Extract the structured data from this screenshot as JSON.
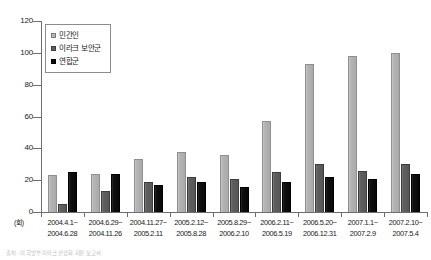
{
  "chart_data": {
    "type": "bar",
    "title": "",
    "xlabel": "",
    "ylabel": "",
    "unit_label": "(회)",
    "ylim": [
      0,
      120
    ],
    "yticks": [
      0,
      20,
      40,
      60,
      80,
      100,
      120
    ],
    "grid": false,
    "legend_position": "top-left",
    "categories": [
      "2004.4.1~\n2004.6.28",
      "2004.6.29~\n2004.11.26",
      "2004.11.27~\n2005.2.11",
      "2005.2.12~\n2005.8.28",
      "2005.8.29~\n2006.2.10",
      "2006.2.11~\n2006.5.19",
      "2006.5.20~\n2006.12.31",
      "2007.1.1~\n2007.2.9",
      "2007.2.10~\n2007.5.4"
    ],
    "categories_line1": [
      "2004.4.1~",
      "2004.6.29~",
      "2004.11.27~",
      "2005.2.12~",
      "2005.8.29~",
      "2006.2.11~",
      "2006.5.20~",
      "2007.1.1~",
      "2007.2.10~"
    ],
    "categories_line2": [
      "2004.6.28",
      "2004.11.26",
      "2005.2.11",
      "2005.8.28",
      "2006.2.10",
      "2006.5.19",
      "2006.12.31",
      "2007.2.9",
      "2007.5.4"
    ],
    "series": [
      {
        "name": "민간인",
        "color": "#b4b4b4",
        "values": [
          23,
          24,
          33,
          38,
          36,
          57,
          93,
          98,
          100
        ]
      },
      {
        "name": "이라크 보안군",
        "color": "#5f5f5f",
        "values": [
          5,
          13,
          19,
          22,
          21,
          25,
          30,
          26,
          30
        ]
      },
      {
        "name": "연합군",
        "color": "#0c0c0c",
        "values": [
          25,
          24,
          17,
          19,
          16,
          19,
          22,
          21,
          24
        ]
      }
    ]
  },
  "legend": {
    "items": [
      {
        "label": "민간인"
      },
      {
        "label": "이라크 보안군"
      },
      {
        "label": "연합군"
      }
    ]
  },
  "caption": {
    "text": "출처 : 미 국방부 이라크 안정화 지원 보고서"
  }
}
